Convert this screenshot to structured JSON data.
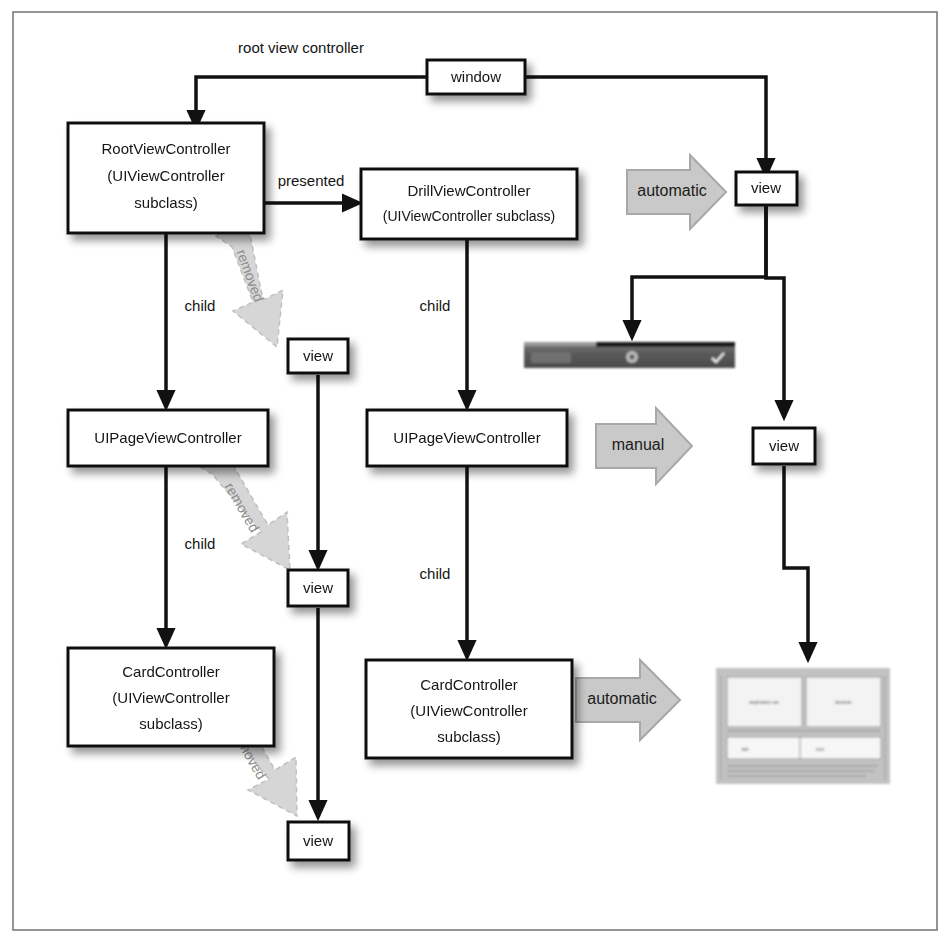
{
  "figure": {
    "background": "#ffffff",
    "frame_color": "#7a7a7a",
    "node_fill": "#ffffff",
    "node_stroke": "#111111",
    "fat_arrow_fill": "#c9c9c9",
    "ghost_arrow_fill": "#cfcfcf"
  },
  "nodes": {
    "window": "window",
    "root_view_controller": "RootViewController\n(UIViewController\nsubclass)",
    "root_vc_line1": "RootViewController",
    "root_vc_line2": "(UIViewController",
    "root_vc_line3": "subclass)",
    "drill_vc_line1": "DrillViewController",
    "drill_vc_line2": "(UIViewController subclass)",
    "page_vc_left": "UIPageViewController",
    "page_vc_middle": "UIPageViewController",
    "card_vc_left_line1": "CardController",
    "card_vc_left_line2": "(UIViewController",
    "card_vc_left_line3": "subclass)",
    "card_vc_middle_line1": "CardController",
    "card_vc_middle_line2": "(UIViewController",
    "card_vc_middle_line3": "subclass)",
    "view_top_right": "view",
    "view_middle_right": "view",
    "view_removed_1": "view",
    "view_removed_2": "view",
    "view_removed_3": "view"
  },
  "edge_labels": {
    "root_view_controller": "root view controller",
    "presented": "presented",
    "child_left_1": "child",
    "child_left_2": "child",
    "child_middle_1": "child",
    "child_middle_2": "child"
  },
  "fat_arrows": {
    "automatic_top": "automatic",
    "manual": "manual",
    "automatic_bottom": "automatic"
  },
  "ghost_arrows": {
    "removed_1": "removed",
    "removed_2": "removed",
    "removed_3": "removed"
  },
  "screenshots": {
    "navbar_thumb": "navigation-bar-screenshot",
    "card_thumb": "card-layout-screenshot"
  }
}
